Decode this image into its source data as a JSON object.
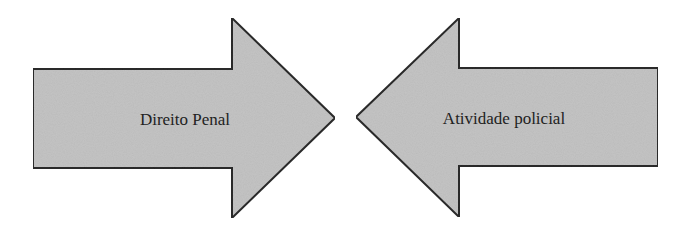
{
  "diagram": {
    "type": "opposing-arrows",
    "fill_color": "#c4c4c4",
    "stroke_color": "#2a2a2a",
    "arrows": [
      {
        "label": "Direito Penal",
        "direction": "right"
      },
      {
        "label": "Atividade policial",
        "direction": "left"
      }
    ]
  }
}
